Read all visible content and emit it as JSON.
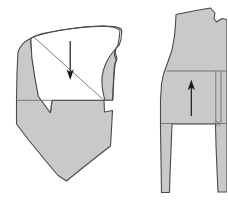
{
  "figure": {
    "title": "Garment pattern draft with two pieces",
    "width": 227,
    "height": 201,
    "background_color": "#ffffff"
  },
  "style": {
    "fill_gray": "#c9c9c9",
    "fill_white": "#ffffff",
    "outline_color": "#4a4a4a",
    "inner_line_color": "#6e6e6e",
    "arrow_color": "#1a1a1a",
    "outline_width": 1.1,
    "inner_line_width": 0.9,
    "arrow_width": 1.2
  },
  "pieces": [
    {
      "id": "left-piece",
      "name": "left-pattern-piece",
      "description": "Bodice pattern piece with folded-back white flap, curved armhole at right and pointed hem at bottom",
      "arrow": {
        "name": "fold-direction-arrow-down",
        "direction": "down",
        "x": 70,
        "y_start": 41,
        "y_end": 79
      },
      "regions": [
        {
          "name": "left-piece-gray-body",
          "fill": "gray",
          "points": "17,44 21,38 27,34 30,44 32,60 35,78 38,96 49,113 51,100 104,100 104,112 112,110 111,128 110,150 95,158 80,170 67,180 56,172 46,160 34,147 25,136 17,124 16,100 16,72"
        },
        {
          "name": "left-piece-white-flap",
          "fill": "white",
          "description": "folded-over white triangular flap"
        },
        {
          "name": "left-piece-armhole-curve",
          "fill": "gray",
          "description": "curved armhole section on right side"
        }
      ],
      "inner_lines": [
        {
          "name": "horizontal-waist-line-left",
          "from": [
            16,
            100
          ],
          "to": [
            52,
            100
          ]
        },
        {
          "name": "horizontal-waist-line-right",
          "from": [
            104,
            100
          ],
          "to": [
            113,
            100
          ]
        },
        {
          "name": "fold-diagonal-line",
          "from": [
            33,
            37
          ],
          "to": [
            104,
            100
          ]
        }
      ]
    },
    {
      "id": "right-piece",
      "name": "right-pattern-piece",
      "description": "Sleeve or trouser pattern piece with rectangular inset panel and upward grainline arrow, extends past right edge",
      "arrow": {
        "name": "grainline-direction-arrow-up",
        "direction": "up",
        "x": 191,
        "y_start": 116,
        "y_end": 80
      },
      "regions": [
        {
          "name": "right-piece-gray-body",
          "fill": "gray",
          "description": "main gray body of right pattern piece"
        }
      ],
      "inner_lines": [
        {
          "name": "upper-horizontal-rule",
          "from": [
            168,
            71
          ],
          "to": [
            227,
            71
          ]
        },
        {
          "name": "lower-horizontal-rule",
          "from": [
            165,
            122
          ],
          "to": [
            227,
            122
          ]
        },
        {
          "name": "vertical-inset-rule",
          "from": [
            217,
            71
          ],
          "to": [
            217,
            124
          ]
        },
        {
          "name": "right-edge-vertical-rule",
          "from": [
            222,
            71
          ],
          "to": [
            222,
            122
          ]
        }
      ]
    }
  ],
  "labels": [],
  "annotations": {
    "arrow_count": 2,
    "piece_count": 2
  }
}
